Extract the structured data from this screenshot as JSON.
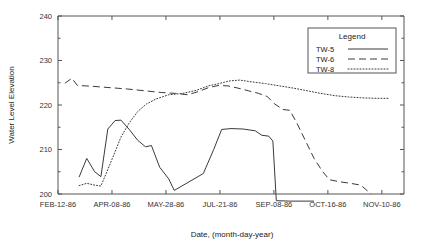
{
  "chart_data": {
    "type": "line",
    "title": "",
    "xlabel": "Date, (month-day-year)",
    "ylabel": "Water Level Elevation",
    "ylim": [
      200,
      240
    ],
    "yticks": [
      200,
      210,
      220,
      230,
      240
    ],
    "yticklabels": [
      "200",
      "210",
      "220",
      "230",
      "240"
    ],
    "y_minor_ticks": [
      205,
      215,
      225,
      235
    ],
    "xticklabels": [
      "FEB-12-86",
      "APR-08-86",
      "MAY-28-86",
      "JUL-21-86",
      "SEP-08-86",
      "OCT-16-86",
      "NOV-10-86"
    ],
    "xlim": [
      0,
      100
    ],
    "xtick_positions": [
      0,
      15.6,
      31.2,
      46.8,
      62.4,
      78.0,
      93.6
    ],
    "grid": false,
    "legend_position": "top-right",
    "legend_title": "Legend",
    "series": [
      {
        "name": "TW-5",
        "style": "solid",
        "points": [
          [
            6.1,
            203.8
          ],
          [
            8.3,
            208.0
          ],
          [
            10.6,
            205.0
          ],
          [
            12.4,
            203.9
          ],
          [
            14.4,
            214.6
          ],
          [
            16.5,
            216.5
          ],
          [
            18.2,
            216.6
          ],
          [
            20.6,
            214.5
          ],
          [
            23.0,
            212.1
          ],
          [
            25.3,
            210.6
          ],
          [
            27.0,
            210.9
          ],
          [
            29.4,
            206.0
          ],
          [
            32.0,
            203.4
          ],
          [
            33.6,
            200.8
          ],
          [
            42.0,
            204.6
          ],
          [
            45.0,
            210.0
          ],
          [
            47.3,
            214.5
          ],
          [
            50.0,
            214.7
          ],
          [
            53.5,
            214.6
          ],
          [
            57.0,
            214.2
          ],
          [
            58.9,
            213.2
          ],
          [
            60.9,
            213.0
          ],
          [
            62.1,
            211.9
          ],
          [
            63.1,
            198.5
          ],
          [
            67.0,
            198.4
          ],
          [
            74.0,
            198.4
          ]
        ]
      },
      {
        "name": "TW-6",
        "style": "dashed",
        "points": [
          [
            2.0,
            224.9
          ],
          [
            4.0,
            226.0
          ],
          [
            5.6,
            224.4
          ],
          [
            10.0,
            224.2
          ],
          [
            15.0,
            223.9
          ],
          [
            20.0,
            223.6
          ],
          [
            25.0,
            223.2
          ],
          [
            30.0,
            222.8
          ],
          [
            34.0,
            222.6
          ],
          [
            37.5,
            222.3
          ],
          [
            40.5,
            223.0
          ],
          [
            43.5,
            223.9
          ],
          [
            46.5,
            224.4
          ],
          [
            49.0,
            224.3
          ],
          [
            52.0,
            223.8
          ],
          [
            55.0,
            223.2
          ],
          [
            58.0,
            222.6
          ],
          [
            60.5,
            221.9
          ],
          [
            62.5,
            220.3
          ],
          [
            65.0,
            219.0
          ],
          [
            67.0,
            218.8
          ],
          [
            69.0,
            216.0
          ],
          [
            71.5,
            212.0
          ],
          [
            74.0,
            208.0
          ],
          [
            76.5,
            205.0
          ],
          [
            78.5,
            203.2
          ],
          [
            81.0,
            202.8
          ],
          [
            84.5,
            202.4
          ],
          [
            87.5,
            202.0
          ],
          [
            90.5,
            200.0
          ]
        ]
      },
      {
        "name": "TW-8",
        "style": "dotted",
        "points": [
          [
            6.1,
            201.9
          ],
          [
            8.3,
            202.4
          ],
          [
            10.6,
            202.0
          ],
          [
            12.4,
            201.8
          ],
          [
            14.4,
            205.5
          ],
          [
            16.5,
            209.5
          ],
          [
            18.2,
            212.8
          ],
          [
            20.6,
            216.0
          ],
          [
            23.0,
            218.5
          ],
          [
            25.5,
            220.2
          ],
          [
            28.5,
            221.4
          ],
          [
            32.0,
            222.3
          ],
          [
            36.0,
            222.6
          ],
          [
            40.0,
            223.3
          ],
          [
            43.5,
            224.3
          ],
          [
            46.5,
            224.8
          ],
          [
            49.5,
            225.4
          ],
          [
            52.5,
            225.6
          ],
          [
            56.0,
            225.2
          ],
          [
            60.0,
            224.8
          ],
          [
            64.0,
            224.3
          ],
          [
            68.0,
            223.8
          ],
          [
            72.0,
            223.2
          ],
          [
            76.0,
            222.6
          ],
          [
            80.0,
            222.1
          ],
          [
            84.0,
            221.8
          ],
          [
            88.0,
            221.6
          ],
          [
            92.0,
            221.5
          ],
          [
            95.5,
            221.5
          ]
        ]
      }
    ]
  },
  "legend": {
    "title": "Legend",
    "entries": [
      {
        "label": "TW-5",
        "style": "solid"
      },
      {
        "label": "TW-6",
        "style": "dashed"
      },
      {
        "label": "TW-8",
        "style": "dotted"
      }
    ]
  }
}
